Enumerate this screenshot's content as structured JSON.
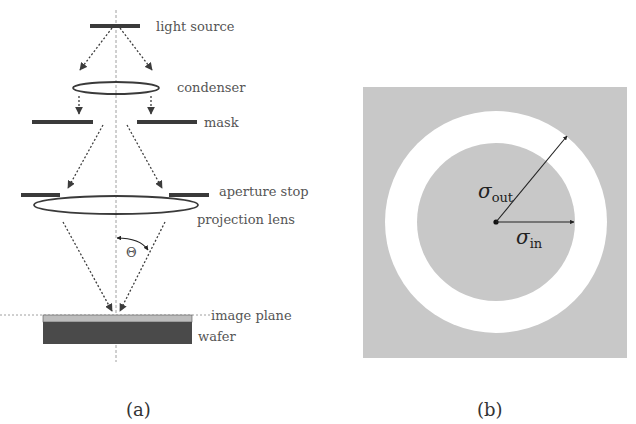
{
  "panel_a": {
    "caption": "(a)",
    "labels": {
      "light_source": "light source",
      "condenser": "condenser",
      "mask": "mask",
      "aperture_stop": "aperture stop",
      "projection_lens": "projection lens",
      "theta": "Θ",
      "image_plane": "image plane",
      "wafer": "wafer"
    }
  },
  "panel_b": {
    "caption": "(b)",
    "sigma_out": {
      "symbol": "σ",
      "subscript": "out"
    },
    "sigma_in": {
      "symbol": "σ",
      "subscript": "in"
    }
  },
  "colors": {
    "background": "#ffffff",
    "dark_bar": "#3a3a3a",
    "gray_fill": "#c8c8c8",
    "image_plane": "#bdbdbd",
    "wafer": "#4a4a4a",
    "annulus": "#ffffff",
    "arrow": "#3c3c3c"
  }
}
